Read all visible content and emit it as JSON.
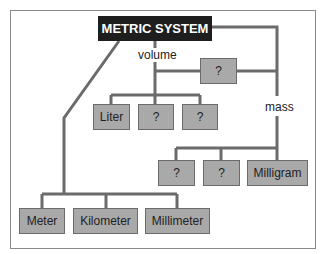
{
  "diagram": {
    "title": "METRIC SYSTEM",
    "colors": {
      "title_bg": "#1e1e1e",
      "box_bg": "#a9a9a9",
      "line": "#6b6b6b"
    },
    "branches": {
      "volume": {
        "label": "volume",
        "parent_unknown": "?",
        "children": [
          "Liter",
          "?",
          "?"
        ]
      },
      "mass": {
        "label": "mass",
        "children": [
          "?",
          "?",
          "Milligram"
        ]
      },
      "length": {
        "children": [
          "Meter",
          "Kilometer",
          "Millimeter"
        ]
      }
    }
  }
}
